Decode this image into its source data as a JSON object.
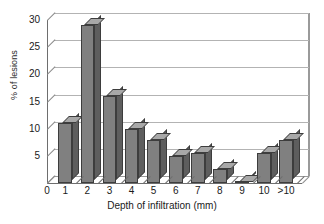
{
  "chart_data": {
    "type": "bar",
    "title": "",
    "xlabel": "Depth of infiltration (mm)",
    "ylabel": "% of lesions",
    "categories": [
      "1",
      "2",
      "3",
      "4",
      "5",
      "6",
      "7",
      "8",
      "9",
      "10",
      ">10"
    ],
    "values": [
      11,
      29,
      16,
      10,
      8,
      5,
      5.5,
      2.5,
      0.2,
      5.5,
      8
    ],
    "ylim": [
      0,
      30
    ],
    "yticks": [
      0,
      5,
      10,
      15,
      20,
      25,
      30
    ],
    "xaxis_origin_label": "0",
    "grid": true,
    "legend": false,
    "style": "3d-column",
    "bar_color": "#808080",
    "bar_top_color": "#a8a8a8",
    "bar_side_color": "#5e5e5e",
    "bar_edge_color": "#3d3d3d",
    "gridline_color": "#b3b3b3",
    "axis_color": "#6e6e6e",
    "background": "#ffffff"
  }
}
